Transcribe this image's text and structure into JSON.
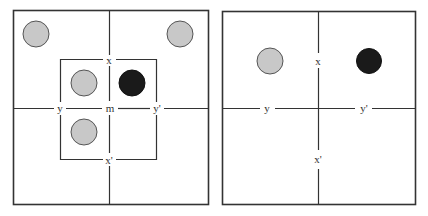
{
  "colors": {
    "line": "#333333",
    "gray_disc": "#c8c8c8",
    "gray_stroke": "#555555",
    "black_disc": "#1a1a1a",
    "background": "#ffffff"
  },
  "left_panel": {
    "labels": {
      "top": "x",
      "bottom": "x'",
      "left": "y",
      "right": "y'",
      "center": "m"
    },
    "discs": [
      {
        "name": "corner-top-left",
        "color": "gray"
      },
      {
        "name": "corner-top-right",
        "color": "gray"
      },
      {
        "name": "inner-top-left",
        "color": "gray"
      },
      {
        "name": "inner-top-right",
        "color": "black"
      },
      {
        "name": "inner-bottom-left",
        "color": "gray"
      }
    ]
  },
  "right_panel": {
    "labels": {
      "top": "x",
      "bottom": "x'",
      "left": "y",
      "right": "y'"
    },
    "discs": [
      {
        "name": "top-left",
        "color": "gray"
      },
      {
        "name": "top-right",
        "color": "black"
      }
    ]
  }
}
